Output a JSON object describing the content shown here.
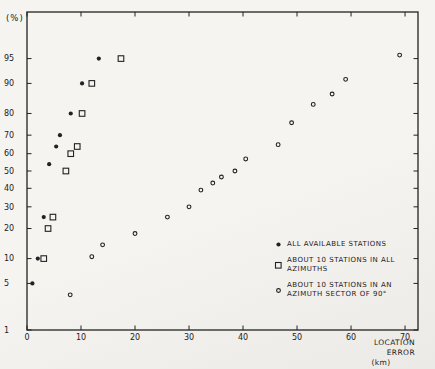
{
  "chart_data": {
    "type": "scatter",
    "title": "",
    "ylabel": "(%)",
    "xlabel": "LOCATION ERROR",
    "xunit": "(km)",
    "y_scale": "probit",
    "grid": false,
    "legend_position": "lower right",
    "xlim": [
      0,
      72.4
    ],
    "plim": [
      1,
      99
    ],
    "x_ticks": [
      0,
      10,
      20,
      30,
      40,
      50,
      60,
      70
    ],
    "y_ticks": [
      1,
      5,
      10,
      20,
      30,
      40,
      50,
      60,
      70,
      80,
      90,
      95
    ],
    "series": [
      {
        "name": "ALL AVAILABLE STATIONS",
        "marker": "filled-circle",
        "points": [
          [
            1,
            5
          ],
          [
            2,
            10
          ],
          [
            3.1,
            25
          ],
          [
            4.1,
            54
          ],
          [
            5.4,
            64
          ],
          [
            6.1,
            70
          ],
          [
            8.1,
            80
          ],
          [
            10.2,
            90
          ],
          [
            13.3,
            95
          ]
        ]
      },
      {
        "name": "ABOUT 10 STATIONS IN ALL AZIMUTHS",
        "marker": "open-square",
        "points": [
          [
            3.1,
            10
          ],
          [
            3.9,
            20
          ],
          [
            4.8,
            25
          ],
          [
            7.2,
            50
          ],
          [
            8.1,
            60
          ],
          [
            9.3,
            64
          ],
          [
            10.2,
            80
          ],
          [
            12,
            90
          ],
          [
            17.4,
            95
          ]
        ]
      },
      {
        "name": "ABOUT 10 STATIONS IN AN AZIMUTH SECTOR OF 90°",
        "marker": "open-circle",
        "points": [
          [
            8,
            3.5
          ],
          [
            12,
            10.5
          ],
          [
            14,
            14
          ],
          [
            20,
            18
          ],
          [
            26,
            25
          ],
          [
            30,
            30
          ],
          [
            32.2,
            39
          ],
          [
            34.4,
            43
          ],
          [
            36,
            46.5
          ],
          [
            38.5,
            50
          ],
          [
            40.5,
            57
          ],
          [
            46.5,
            65
          ],
          [
            49,
            76
          ],
          [
            53,
            83.5
          ],
          [
            56.5,
            87
          ],
          [
            59,
            91
          ],
          [
            69,
            95.5
          ]
        ]
      }
    ]
  },
  "colors": {
    "paper": "#f4f3f0",
    "ink": "#222222"
  }
}
